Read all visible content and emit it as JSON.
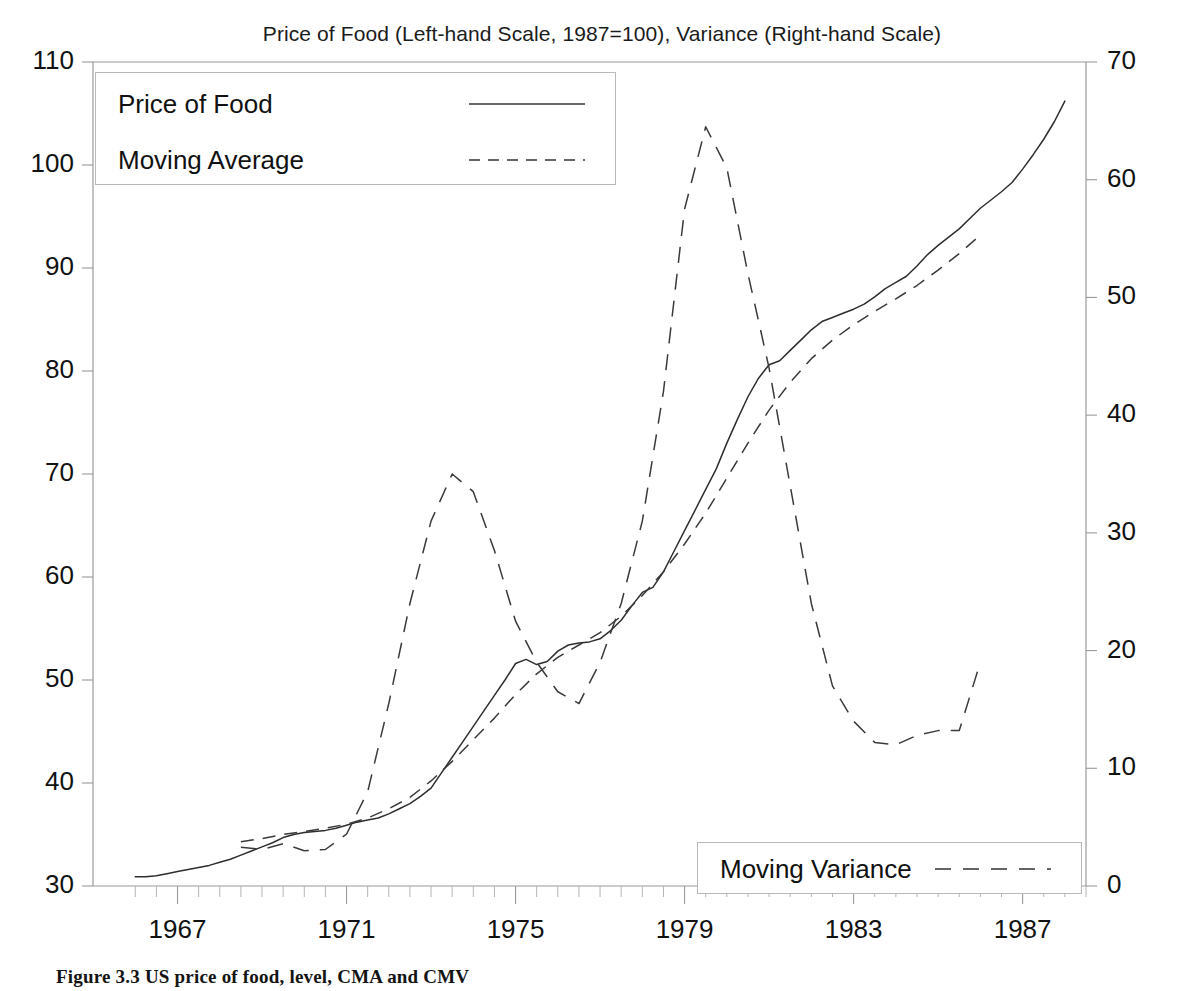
{
  "figure": {
    "caption": "Figure 3.3   US price of food, level, CMA and CMV"
  },
  "chart_data": {
    "type": "line",
    "title": "Price of Food (Left-hand Scale, 1987=100), Variance (Right-hand Scale)",
    "xlabel": "",
    "ylabel": "",
    "y2label": "",
    "xlim": [
      1965.0,
      1988.5
    ],
    "ylim": [
      30,
      110
    ],
    "y2lim": [
      0,
      70
    ],
    "xticks": [
      "1967",
      "1971",
      "1975",
      "1979",
      "1983",
      "1987"
    ],
    "xtick_values": [
      1967,
      1971,
      1975,
      1979,
      1983,
      1987
    ],
    "xtick_minor_step": 0.5,
    "yticks_left": [
      "110",
      "100",
      "90",
      "80",
      "70",
      "60",
      "50",
      "40",
      "30"
    ],
    "ytick_left_values": [
      110,
      100,
      90,
      80,
      70,
      60,
      50,
      40,
      30
    ],
    "yticks_right": [
      "70",
      "60",
      "50",
      "40",
      "30",
      "20",
      "10",
      "0"
    ],
    "ytick_right_values": [
      70,
      60,
      50,
      40,
      30,
      20,
      10,
      0
    ],
    "grid": false,
    "legend_position": [
      "upper-left",
      "lower-right"
    ],
    "series": [
      {
        "name": "Price of Food",
        "axis": "left",
        "style": "solid",
        "x": [
          1966.0,
          1966.25,
          1966.5,
          1966.75,
          1967.0,
          1967.25,
          1967.5,
          1967.75,
          1968.0,
          1968.25,
          1968.5,
          1968.75,
          1969.0,
          1969.25,
          1969.5,
          1969.75,
          1970.0,
          1970.25,
          1970.5,
          1970.75,
          1971.0,
          1971.25,
          1971.5,
          1971.75,
          1972.0,
          1972.25,
          1972.5,
          1972.75,
          1973.0,
          1973.25,
          1973.5,
          1973.75,
          1974.0,
          1974.25,
          1974.5,
          1974.75,
          1975.0,
          1975.25,
          1975.5,
          1975.75,
          1976.0,
          1976.25,
          1976.5,
          1976.75,
          1977.0,
          1977.25,
          1977.5,
          1977.75,
          1978.0,
          1978.25,
          1978.5,
          1978.75,
          1979.0,
          1979.25,
          1979.5,
          1979.75,
          1980.0,
          1980.25,
          1980.5,
          1980.75,
          1981.0,
          1981.25,
          1981.5,
          1981.75,
          1982.0,
          1982.25,
          1982.5,
          1982.75,
          1983.0,
          1983.25,
          1983.5,
          1983.75,
          1984.0,
          1984.25,
          1984.5,
          1984.75,
          1985.0,
          1985.25,
          1985.5,
          1985.75,
          1986.0,
          1986.25,
          1986.5,
          1986.75,
          1987.0,
          1987.25,
          1987.5,
          1987.75,
          1988.0
        ],
        "y": [
          30.9,
          30.9,
          31.0,
          31.2,
          31.4,
          31.6,
          31.8,
          32.0,
          32.3,
          32.6,
          33.0,
          33.4,
          33.8,
          34.2,
          34.7,
          35.0,
          35.2,
          35.3,
          35.4,
          35.6,
          35.9,
          36.2,
          36.4,
          36.6,
          37.0,
          37.5,
          38.0,
          38.7,
          39.5,
          41.0,
          42.5,
          44.0,
          45.5,
          47.0,
          48.5,
          50.0,
          51.6,
          52.0,
          51.5,
          51.8,
          52.8,
          53.4,
          53.6,
          53.7,
          54.0,
          54.8,
          55.8,
          57.2,
          58.5,
          59.0,
          60.5,
          62.5,
          64.5,
          66.5,
          68.5,
          70.5,
          73.0,
          75.3,
          77.5,
          79.3,
          80.6,
          81.0,
          82.0,
          83.0,
          84.0,
          84.8,
          85.2,
          85.6,
          86.0,
          86.5,
          87.2,
          88.0,
          88.6,
          89.2,
          90.2,
          91.3,
          92.2,
          93.0,
          93.8,
          94.8,
          95.8,
          96.6,
          97.4,
          98.3,
          99.6,
          101.0,
          102.5,
          104.2,
          106.2
        ]
      },
      {
        "name": "Moving Average",
        "axis": "left",
        "style": "dashed",
        "x": [
          1968.5,
          1969.0,
          1969.5,
          1970.0,
          1970.5,
          1971.0,
          1971.5,
          1972.0,
          1972.5,
          1973.0,
          1973.5,
          1974.0,
          1974.5,
          1975.0,
          1975.5,
          1976.0,
          1976.5,
          1977.0,
          1977.5,
          1978.0,
          1978.5,
          1979.0,
          1979.5,
          1980.0,
          1980.5,
          1981.0,
          1981.5,
          1982.0,
          1982.5,
          1983.0,
          1983.5,
          1984.0,
          1984.5,
          1985.0,
          1985.5,
          1986.0
        ],
        "y": [
          34.3,
          34.6,
          35.0,
          35.3,
          35.6,
          36.0,
          36.6,
          37.5,
          38.6,
          40.2,
          42.1,
          44.2,
          46.3,
          48.6,
          50.6,
          52.2,
          53.4,
          54.6,
          56.2,
          58.2,
          60.5,
          63.2,
          66.2,
          69.6,
          73.0,
          76.2,
          78.9,
          81.2,
          83.0,
          84.5,
          85.8,
          87.0,
          88.3,
          89.8,
          91.4,
          93.2
        ]
      },
      {
        "name": "Moving Variance",
        "axis": "right",
        "style": "dashed-long",
        "x": [
          1968.5,
          1969.0,
          1969.5,
          1970.0,
          1970.5,
          1971.0,
          1971.5,
          1972.0,
          1972.5,
          1973.0,
          1973.5,
          1974.0,
          1974.5,
          1975.0,
          1975.5,
          1976.0,
          1976.5,
          1977.0,
          1977.5,
          1978.0,
          1978.5,
          1979.0,
          1979.5,
          1980.0,
          1980.5,
          1981.0,
          1981.5,
          1982.0,
          1982.5,
          1983.0,
          1983.5,
          1984.0,
          1984.5,
          1985.0,
          1985.5,
          1986.0
        ],
        "y": [
          3.3,
          3.1,
          3.6,
          3.0,
          3.1,
          4.4,
          8.0,
          15.5,
          24.0,
          31.0,
          35.0,
          33.5,
          28.5,
          22.5,
          19.0,
          16.5,
          15.5,
          19.0,
          24.0,
          31.0,
          42.0,
          57.5,
          64.5,
          61.0,
          52.0,
          44.0,
          34.0,
          24.0,
          17.0,
          14.0,
          12.2,
          12.0,
          12.8,
          13.2,
          13.2,
          19.0
        ]
      }
    ]
  },
  "legends": {
    "top": {
      "entries": [
        {
          "label": "Price of Food",
          "style": "solid"
        },
        {
          "label": "Moving Average",
          "style": "dashed"
        }
      ]
    },
    "bottom": {
      "entries": [
        {
          "label": "Moving Variance",
          "style": "dashed-long"
        }
      ]
    }
  }
}
